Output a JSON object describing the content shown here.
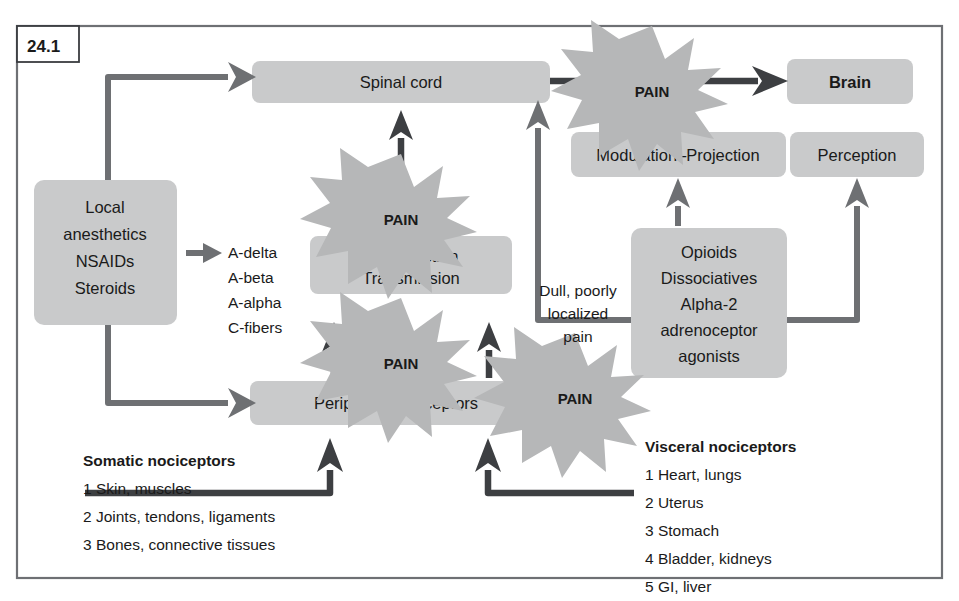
{
  "figure": {
    "tag": "24.1"
  },
  "colors": {
    "box_fill": "#c9cacb",
    "burst_fill": "#b6b7b8",
    "arrow_grey": "#6e7073",
    "arrow_dark": "#3d3f42",
    "frame": "#6e7074",
    "text": "#1a1a1a",
    "background": "#ffffff"
  },
  "nodes": {
    "spinal_cord": "Spinal cord",
    "brain": "Brain",
    "modulation_projection": "Modulation–Projection",
    "perception": "Perception",
    "transduction_transmission_line1": "Transduction",
    "transduction_transmission_line2": "Transmission",
    "peripheral_nociceptors": "Peripheral nociceptors",
    "left_drugs": [
      "Local",
      "anesthetics",
      "NSAIDs",
      "Steroids"
    ],
    "central_drugs": [
      "Opioids",
      "Dissociatives",
      "Alpha-2",
      "adrenoceptor",
      "agonists"
    ]
  },
  "bursts": {
    "burst_label": "PAIN",
    "count": 4,
    "labels": [
      "PAIN",
      "PAIN",
      "PAIN",
      "PAIN"
    ]
  },
  "fibers": {
    "items": [
      "A-delta",
      "A-beta",
      "A-alpha",
      "C-fibers"
    ]
  },
  "captions": {
    "dull_pain": [
      "Dull, poorly",
      "localized",
      "pain"
    ]
  },
  "lists": {
    "somatic": {
      "heading": "Somatic nociceptors",
      "items": [
        "1 Skin, muscles",
        "2 Joints, tendons, ligaments",
        "3 Bones, connective tissues"
      ]
    },
    "visceral": {
      "heading": "Visceral nociceptors",
      "items": [
        "1 Heart, lungs",
        "2 Uterus",
        "3 Stomach",
        "4 Bladder, kidneys",
        "5 GI, liver"
      ]
    }
  }
}
